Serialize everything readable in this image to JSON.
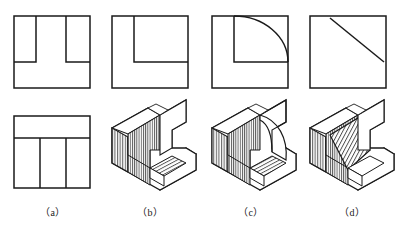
{
  "figure": {
    "kind": "engineering-drawing-multiple-choice",
    "line_color": "#1a1a1a",
    "background_color": "#ffffff",
    "hatch_color": "#3a3a3a",
    "columns": [
      {
        "id": "a",
        "caption": "（a）",
        "caption_x": 40,
        "type": "orthographic-views",
        "views": [
          {
            "name": "front-view",
            "shape": "rectangle-with-two-slots",
            "outline": [
              [
                14,
                16
              ],
              [
                90,
                16
              ],
              [
                90,
                88
              ],
              [
                14,
                88
              ]
            ],
            "internal_lines": [
              [
                [
                  36,
                  16
                ],
                [
                  36,
                  62
                ]
              ],
              [
                [
                  36,
                  62
                ],
                [
                  14,
                  62
                ]
              ],
              [
                [
                  66,
                  16
                ],
                [
                  66,
                  62
                ]
              ],
              [
                [
                  66,
                  62
                ],
                [
                  90,
                  62
                ]
              ]
            ]
          },
          {
            "name": "top-view",
            "shape": "rectangle-with-tee",
            "outline": [
              [
                14,
                116
              ],
              [
                90,
                116
              ],
              [
                90,
                188
              ],
              [
                14,
                188
              ]
            ],
            "internal_lines": [
              [
                [
                  14,
                  138
                ],
                [
                  90,
                  138
                ]
              ],
              [
                [
                  40,
                  138
                ],
                [
                  40,
                  188
                ]
              ],
              [
                [
                  66,
                  138
                ],
                [
                  66,
                  188
                ]
              ]
            ]
          }
        ]
      },
      {
        "id": "b",
        "caption": "（b）",
        "caption_x": 137,
        "type": "isometric-candidate",
        "views": [
          {
            "name": "front-view",
            "shape": "L-shaped-notch",
            "outline": [
              [
                112,
                16
              ],
              [
                188,
                16
              ],
              [
                188,
                88
              ],
              [
                112,
                88
              ]
            ],
            "internal_lines": [
              [
                [
                  134,
                  16
                ],
                [
                  134,
                  62
                ]
              ],
              [
                [
                  134,
                  62
                ],
                [
                  188,
                  62
                ]
              ]
            ]
          }
        ],
        "solid": {
          "name": "u-channel-block",
          "features": [
            "vertical-walls",
            "flat-floor",
            "stepped-base"
          ]
        }
      },
      {
        "id": "c",
        "caption": "（c）",
        "caption_x": 238,
        "type": "isometric-candidate",
        "views": [
          {
            "name": "front-view",
            "shape": "quarter-round-fillet",
            "outline": [
              [
                212,
                16
              ],
              [
                288,
                16
              ],
              [
                288,
                88
              ],
              [
                212,
                88
              ]
            ],
            "internal_lines": [
              [
                [
                  234,
                  16
                ],
                [
                  234,
                  62
                ]
              ],
              [
                [
                  234,
                  62
                ],
                [
                  288,
                  62
                ]
              ]
            ],
            "arc": {
              "from": [
                234,
                16
              ],
              "to": [
                288,
                62
              ],
              "radius": 54,
              "sweep": "convex-outward"
            }
          }
        ],
        "solid": {
          "name": "curved-wall-block",
          "features": [
            "quarter-round-wall",
            "flat-floor",
            "stepped-base"
          ]
        }
      },
      {
        "id": "d",
        "caption": "（d）",
        "caption_x": 339,
        "type": "isometric-candidate",
        "views": [
          {
            "name": "front-view",
            "shape": "square-with-diagonal",
            "outline": [
              [
                310,
                16
              ],
              [
                386,
                16
              ],
              [
                386,
                88
              ],
              [
                310,
                88
              ]
            ],
            "internal_lines": [],
            "diagonal": {
              "from": [
                330,
                18
              ],
              "to": [
                384,
                62
              ]
            }
          }
        ],
        "solid": {
          "name": "inclined-ramp-block",
          "features": [
            "sloped-face",
            "hatched-ramp",
            "stepped-base"
          ]
        }
      }
    ]
  }
}
